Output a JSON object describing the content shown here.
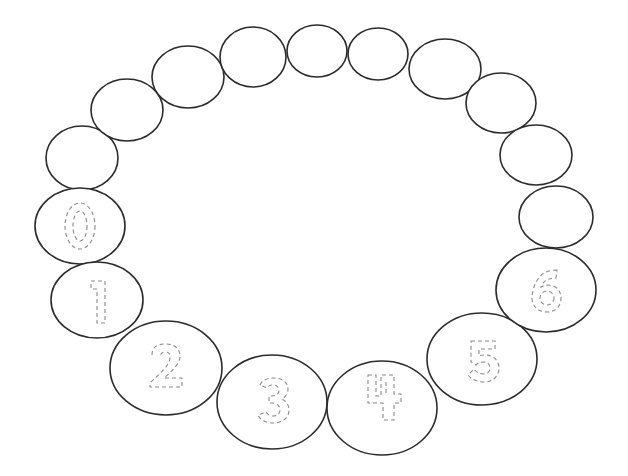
{
  "worksheet": {
    "title": "Number tracing ring 0-6",
    "stroke_color": "#2b2b2b",
    "trace_color": "#8a8a8a",
    "background": "#ffffff"
  },
  "empty_beads": [
    {
      "cx": 82,
      "cy": 158,
      "rx": 36,
      "ry": 32
    },
    {
      "cx": 127,
      "cy": 110,
      "rx": 36,
      "ry": 31
    },
    {
      "cx": 188,
      "cy": 77,
      "rx": 36,
      "ry": 31
    },
    {
      "cx": 253,
      "cy": 57,
      "rx": 33,
      "ry": 30
    },
    {
      "cx": 317,
      "cy": 51,
      "rx": 30,
      "ry": 26
    },
    {
      "cx": 378,
      "cy": 54,
      "rx": 30,
      "ry": 26
    },
    {
      "cx": 445,
      "cy": 69,
      "rx": 36,
      "ry": 30
    },
    {
      "cx": 501,
      "cy": 103,
      "rx": 35,
      "ry": 30
    },
    {
      "cx": 536,
      "cy": 155,
      "rx": 36,
      "ry": 30
    },
    {
      "cx": 556,
      "cy": 217,
      "rx": 37,
      "ry": 31
    }
  ],
  "digit_beads": [
    {
      "digit": "0",
      "cx": 80,
      "cy": 226,
      "rx": 45,
      "ry": 38
    },
    {
      "digit": "1",
      "cx": 97,
      "cy": 300,
      "rx": 46,
      "ry": 38
    },
    {
      "digit": "2",
      "cx": 166,
      "cy": 368,
      "rx": 56,
      "ry": 47
    },
    {
      "digit": "3",
      "cx": 272,
      "cy": 402,
      "rx": 55,
      "ry": 47
    },
    {
      "digit": "4",
      "cx": 382,
      "cy": 408,
      "rx": 55,
      "ry": 47
    },
    {
      "digit": "5",
      "cx": 482,
      "cy": 359,
      "rx": 55,
      "ry": 46
    },
    {
      "digit": "6",
      "cx": 546,
      "cy": 290,
      "rx": 50,
      "ry": 42
    }
  ]
}
